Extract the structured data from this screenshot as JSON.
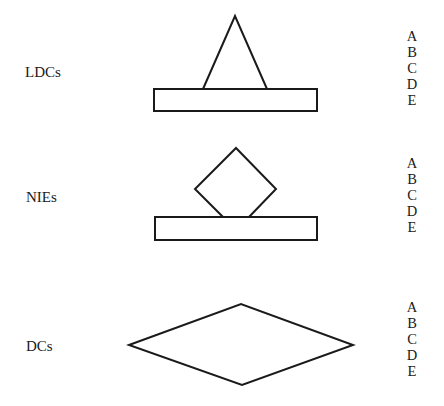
{
  "rows": [
    {
      "id": "ldcs",
      "label": "LDCs",
      "shape": "triangle-on-bar",
      "letters": [
        "A",
        "B",
        "C",
        "D",
        "E"
      ]
    },
    {
      "id": "nies",
      "label": "NIEs",
      "shape": "diamond-on-bar",
      "letters": [
        "A",
        "B",
        "C",
        "D",
        "E"
      ]
    },
    {
      "id": "dcs",
      "label": "DCs",
      "shape": "rhombus",
      "letters": [
        "A",
        "B",
        "C",
        "D",
        "E"
      ]
    }
  ]
}
